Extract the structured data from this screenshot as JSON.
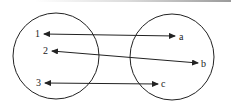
{
  "diagram": {
    "type": "mapping",
    "domain_set": {
      "elements": [
        {
          "label": "1",
          "x": 35,
          "y": 37
        },
        {
          "label": "2",
          "x": 43,
          "y": 54
        },
        {
          "label": "3",
          "x": 36,
          "y": 86
        }
      ]
    },
    "codomain_set": {
      "elements": [
        {
          "label": "a",
          "x": 178,
          "y": 40
        },
        {
          "label": "b",
          "x": 201,
          "y": 67
        },
        {
          "label": "c",
          "x": 161,
          "y": 87
        }
      ]
    },
    "arrows": [
      {
        "from": "1",
        "to": "a",
        "style": "double-headed"
      },
      {
        "from": "2",
        "to": "b",
        "style": "double-headed"
      },
      {
        "from": "3",
        "to": "c",
        "style": "double-headed"
      }
    ],
    "colors": {
      "stroke": "#222222",
      "background": "#ffffff"
    }
  }
}
